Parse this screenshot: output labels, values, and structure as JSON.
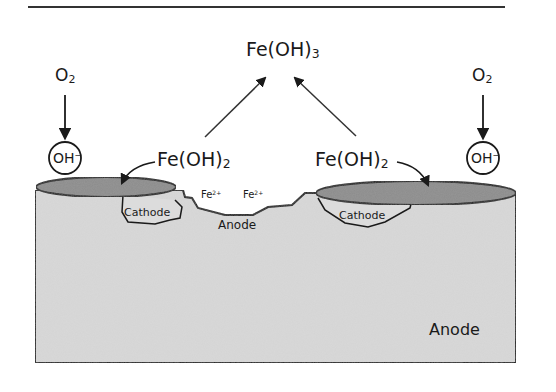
{
  "figure": {
    "title_compound": {
      "base": "Fe(OH)",
      "subscript": "3"
    },
    "intermediate_compound_left": {
      "base": "Fe(OH)",
      "subscript": "2"
    },
    "intermediate_compound_right": {
      "base": "Fe(OH)",
      "subscript": "2"
    },
    "oxygen_left": {
      "base": "O",
      "subscript": "2"
    },
    "oxygen_right": {
      "base": "O",
      "subscript": "2"
    },
    "hydroxide_left": {
      "base": "OH",
      "superscript": "−"
    },
    "hydroxide_right": {
      "base": "OH",
      "superscript": "−"
    },
    "ion_left": {
      "base": "Fe",
      "superscript": "2+"
    },
    "ion_right": {
      "base": "Fe",
      "superscript": "2+"
    },
    "cathode_left_label": "Cathode",
    "cathode_right_label": "Cathode",
    "pit_anode_label": "Anode",
    "bulk_anode_label": "Anode"
  },
  "colors": {
    "metal_fill": "#d9d9d9",
    "deposit_fill": "#8c8c8c",
    "line": "#1a1a1a",
    "background": "#ffffff"
  }
}
